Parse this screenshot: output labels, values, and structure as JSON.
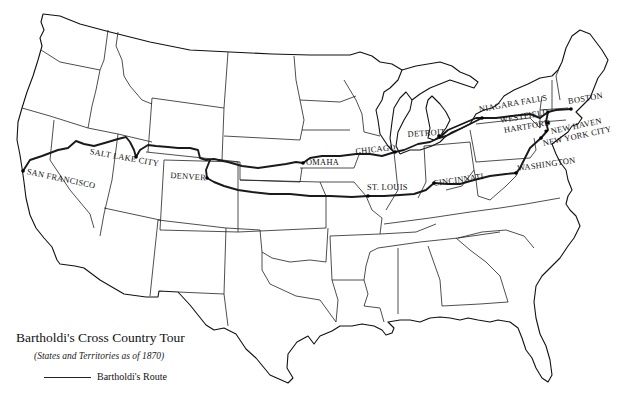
{
  "map": {
    "title": "Bartholdi's Cross Country Tour",
    "subtitle": "(States and Territories as of 1870)",
    "legend": {
      "route_label": "Bartholdi's Route",
      "route_color": "#1a1a1a"
    },
    "cities": [
      {
        "name": "SAN FRANCISCO",
        "x": 23,
        "y": 171
      },
      {
        "name": "SALT LAKE CITY",
        "x": 136,
        "y": 157
      },
      {
        "name": "DENVER",
        "x": 207,
        "y": 178
      },
      {
        "name": "OMAHA",
        "x": 303,
        "y": 163
      },
      {
        "name": "CHICAGO",
        "x": 395,
        "y": 152
      },
      {
        "name": "DETROIT",
        "x": 439,
        "y": 136
      },
      {
        "name": "NIAGARA FALLS",
        "x": 482,
        "y": 118
      },
      {
        "name": "WESTFIELD",
        "x": 548,
        "y": 112
      },
      {
        "name": "HARTFORD",
        "x": 550,
        "y": 123
      },
      {
        "name": "BOSTON",
        "x": 571,
        "y": 109
      },
      {
        "name": "NEW HAVEN",
        "x": 547,
        "y": 131
      },
      {
        "name": "NEW YORK CITY",
        "x": 541,
        "y": 138
      },
      {
        "name": "WASHINGTON",
        "x": 516,
        "y": 173
      },
      {
        "name": "CINCINNATI",
        "x": 434,
        "y": 183
      },
      {
        "name": "ST. LOUIS",
        "x": 368,
        "y": 196
      }
    ]
  }
}
